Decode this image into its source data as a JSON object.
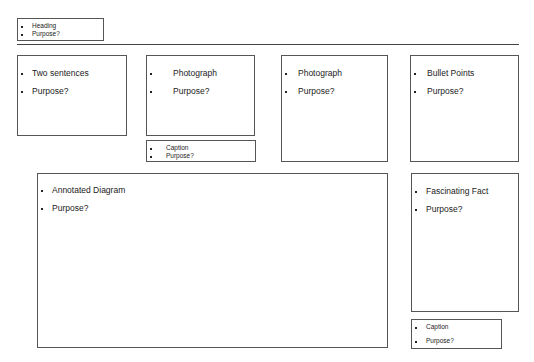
{
  "heading_box": {
    "items": [
      "Heading",
      "Purpose?"
    ]
  },
  "boxes": [
    {
      "id": "two-sentences",
      "items": [
        "Two sentences",
        "Purpose?"
      ]
    },
    {
      "id": "photograph-1",
      "items": [
        "Photograph",
        "Purpose?"
      ]
    },
    {
      "id": "photograph-1-caption",
      "items": [
        "Caption",
        "Purpose?"
      ]
    },
    {
      "id": "photograph-2",
      "items": [
        "Photograph",
        "Purpose?"
      ]
    },
    {
      "id": "bullet-points",
      "items": [
        "Bullet Points",
        "Purpose?"
      ]
    },
    {
      "id": "annotated-diagram",
      "items": [
        "Annotated Diagram",
        "Purpose?"
      ]
    },
    {
      "id": "fascinating-fact",
      "items": [
        "Fascinating Fact",
        "Purpose?"
      ]
    },
    {
      "id": "fascinating-fact-caption",
      "items": [
        "Caption",
        "Purpose?"
      ]
    }
  ]
}
